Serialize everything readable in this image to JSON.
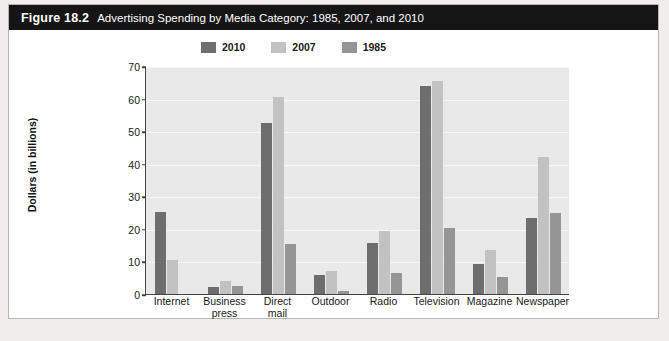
{
  "figure": {
    "number": "Figure 18.2",
    "title": "Advertising Spending by Media Category: 1985, 2007, and 2010"
  },
  "legend": {
    "position": "top-center",
    "items": [
      {
        "label": "2010",
        "color": "#6e6e6e"
      },
      {
        "label": "2007",
        "color": "#c2c2c2"
      },
      {
        "label": "1985",
        "color": "#959595"
      }
    ]
  },
  "axes": {
    "y_title": "Dollars (in billions)",
    "y_ticks": [
      "0",
      "10",
      "20",
      "30",
      "40",
      "50",
      "60",
      "70"
    ]
  },
  "colors": {
    "plot_background": "#e9e9e9",
    "gridline": "#f6f6f6",
    "axis": "#444444",
    "title_bar": "#151515",
    "card_background": "#ffffff",
    "page_background": "#f0eeec"
  },
  "chart_data": {
    "type": "bar",
    "title": "Advertising Spending by Media Category: 1985, 2007, and 2010",
    "xlabel": "",
    "ylabel": "Dollars (in billions)",
    "ylim": [
      0,
      70
    ],
    "ytick_step": 10,
    "grid": true,
    "legend_position": "top-center",
    "categories": [
      "Internet",
      "Business press",
      "Direct mail",
      "Outdoor",
      "Radio",
      "Television",
      "Magazine",
      "Newspaper"
    ],
    "category_lines": [
      [
        "Internet"
      ],
      [
        "Business",
        "press"
      ],
      [
        "Direct",
        "mail"
      ],
      [
        "Outdoor"
      ],
      [
        "Radio"
      ],
      [
        "Television"
      ],
      [
        "Magazine"
      ],
      [
        "Newspaper"
      ]
    ],
    "series": [
      {
        "name": "2010",
        "color": "#6e6e6e",
        "values": [
          25.2,
          2.3,
          52.5,
          5.7,
          15.8,
          64.0,
          9.1,
          23.2
        ]
      },
      {
        "name": "2007",
        "color": "#c2c2c2",
        "values": [
          10.5,
          4.0,
          60.4,
          7.1,
          19.2,
          65.4,
          13.6,
          42.1
        ]
      },
      {
        "name": "1985",
        "color": "#959595",
        "values": [
          0,
          2.4,
          15.5,
          0.9,
          6.3,
          20.4,
          5.1,
          25.0
        ]
      }
    ]
  }
}
